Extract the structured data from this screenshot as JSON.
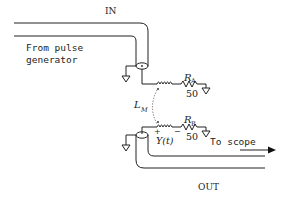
{
  "diagram": {
    "labels": {
      "input": "IN",
      "output": "OUT",
      "source": [
        "From pulse",
        "generator"
      ],
      "destination": "To scope",
      "mutual_inductance": "L",
      "mutual_inductance_sub": "M",
      "resistor_a": "R",
      "resistor_a_sub": "A",
      "resistor_a_value": "50",
      "resistor_b": "R",
      "resistor_b_sub": "B",
      "resistor_b_value": "50",
      "induced_voltage": "Y(t)",
      "plus_sign": "+",
      "minus_sign": "−"
    },
    "components": [
      {
        "id": "coax-in",
        "type": "coaxial-cable",
        "label": "IN"
      },
      {
        "id": "coax-out",
        "type": "coaxial-cable",
        "label": "OUT"
      },
      {
        "id": "inductor-a",
        "type": "inductor"
      },
      {
        "id": "inductor-b",
        "type": "inductor"
      },
      {
        "id": "resistor-a",
        "type": "resistor",
        "name": "RA",
        "value_ohms": 50
      },
      {
        "id": "resistor-b",
        "type": "resistor",
        "name": "RB",
        "value_ohms": 50
      },
      {
        "id": "coupling",
        "type": "mutual-inductance",
        "name": "LM"
      }
    ]
  }
}
